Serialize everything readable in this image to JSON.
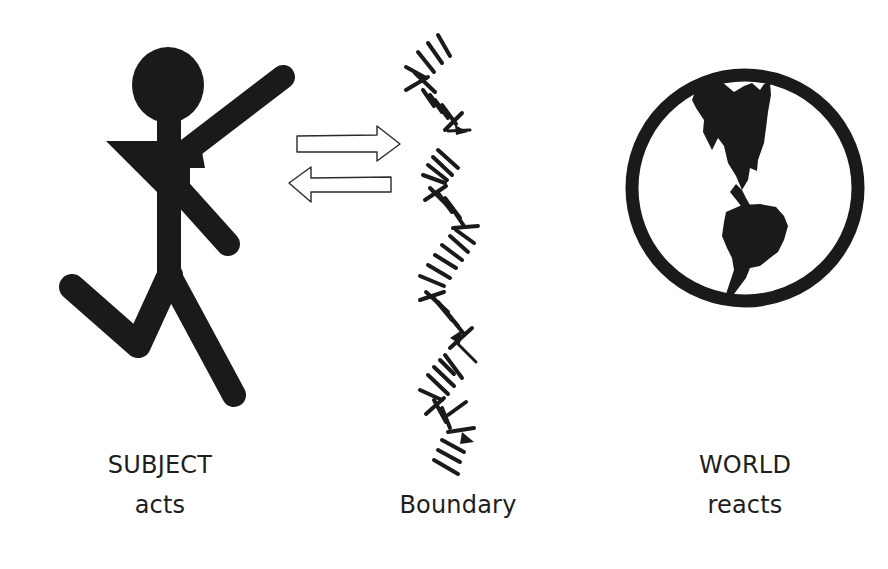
{
  "diagram": {
    "subject": {
      "title": "SUBJECT",
      "caption": "acts",
      "icon": "running-stick-figure-icon"
    },
    "boundary": {
      "title": "Boundary",
      "icon": "zigzag-hatched-boundary-icon"
    },
    "interaction": {
      "arrows": [
        {
          "direction": "right",
          "meaning": "subject to world"
        },
        {
          "direction": "left",
          "meaning": "world to subject"
        }
      ]
    },
    "world": {
      "title": "WORLD",
      "caption": "reacts",
      "icon": "globe-americas-icon"
    },
    "colors": {
      "ink": "#1a1a1a",
      "background": "#ffffff"
    }
  }
}
